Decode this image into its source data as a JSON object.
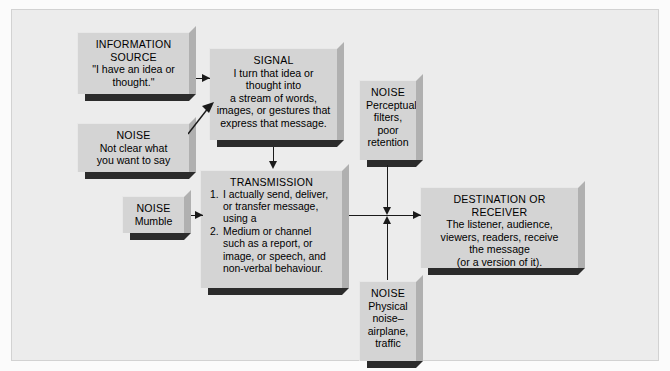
{
  "diagram": {
    "background_color": "#ececec",
    "box_face_color": "#d4d4d4",
    "box_bevel_color": "#b0b0b0",
    "box_shadow_color": "#2b2b2b",
    "connector_color": "#1a1a1a"
  },
  "nodes": {
    "information_source": {
      "title": "INFORMATION\nSOURCE",
      "title_line1": "INFORMATION",
      "title_line2": "SOURCE",
      "body": "\"I have an idea or\nthought.\"",
      "body_line1": "\"I have an idea or",
      "body_line2": "thought.\""
    },
    "noise_unclear": {
      "title": "NOISE",
      "body_line1": "Not clear what",
      "body_line2": "you want to say"
    },
    "signal": {
      "title": "SIGNAL",
      "body_line1": "I turn that idea or",
      "body_line2": "thought into",
      "body_line3": "a stream of words,",
      "body_line4": "images, or gestures that",
      "body_line5": "express that message."
    },
    "noise_perceptual": {
      "title": "NOISE",
      "body_line1": "Perceptual",
      "body_line2": "filters,",
      "body_line3": "poor",
      "body_line4": "retention"
    },
    "noise_mumble": {
      "title": "NOISE",
      "body_line1": "Mumble"
    },
    "transmission": {
      "title": "TRANSMISSION",
      "items": [
        {
          "num": "1.",
          "text": "I actually send, deliver, or transfer message, using a"
        },
        {
          "num": "2.",
          "text": "Medium or channel such as a report, or image, or speech, and non-verbal behaviour."
        }
      ]
    },
    "noise_physical": {
      "title": "NOISE",
      "body_line1": "Physical",
      "body_line2": "noise–",
      "body_line3": "airplane,",
      "body_line4": "traffic"
    },
    "destination": {
      "title": "DESTINATION OR RECEIVER",
      "body_line1": "The listener, audience,",
      "body_line2": "viewers, readers, receive",
      "body_line3": "the message",
      "body_line4": "(or a version of it)."
    }
  },
  "connectors": [
    {
      "name": "source-to-signal",
      "from": "information_source",
      "to": "signal",
      "style": "horizontal-arrow"
    },
    {
      "name": "noise-unclear-to-signal",
      "from": "noise_unclear",
      "to": "signal",
      "style": "diagonal-arrow"
    },
    {
      "name": "signal-to-transmission",
      "from": "signal",
      "to": "transmission",
      "style": "vertical-arrow-down"
    },
    {
      "name": "noise-mumble-to-transmission",
      "from": "noise_mumble",
      "to": "transmission",
      "style": "horizontal-arrow"
    },
    {
      "name": "transmission-to-destination",
      "from": "transmission",
      "to": "destination",
      "style": "horizontal-arrow"
    },
    {
      "name": "noise-perceptual-to-channel",
      "from": "noise_perceptual",
      "to": "transmission-destination-channel",
      "style": "vertical-arrow-down"
    },
    {
      "name": "noise-physical-to-channel",
      "from": "noise_physical",
      "to": "transmission-destination-channel",
      "style": "vertical-arrow-up"
    }
  ]
}
